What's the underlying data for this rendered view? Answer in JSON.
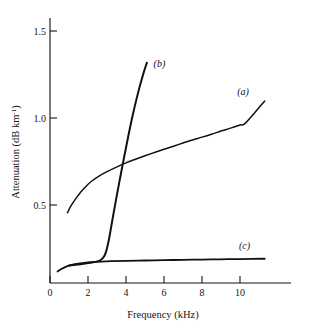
{
  "chart_data": {
    "type": "line",
    "title": "",
    "xlabel": "Frequency  (kHz)",
    "ylabel": "Attenuation (dB km",
    "ylabel_sup": "-1",
    "ylabel_close": ")",
    "xlim": [
      0,
      12.6
    ],
    "ylim": [
      0,
      1.525
    ],
    "grid": false,
    "legend_position": "inline-curve-labels",
    "xticks": [
      0,
      2,
      4,
      6,
      8,
      10
    ],
    "xtick_labels": [
      "0",
      "2",
      "4",
      "6",
      "8",
      "10"
    ],
    "yticks": [
      0.5,
      1.0,
      1.5
    ],
    "ytick_labels": [
      "0.5",
      "1.0",
      "1.5"
    ],
    "series": [
      {
        "name": "a",
        "label": "(a)",
        "label_x": 9.85,
        "label_y": 1.135,
        "x": [
          0.92,
          1.1,
          1.35,
          1.6,
          1.9,
          2.2,
          2.6,
          3.0,
          3.5,
          4.0,
          4.5,
          5.0,
          5.5,
          6.0,
          6.5,
          7.0,
          7.5,
          8.0,
          8.5,
          9.0,
          9.5,
          10.0,
          10.3,
          11.3
        ],
        "y": [
          0.455,
          0.495,
          0.535,
          0.572,
          0.608,
          0.638,
          0.668,
          0.692,
          0.718,
          0.742,
          0.763,
          0.783,
          0.802,
          0.82,
          0.838,
          0.856,
          0.874,
          0.89,
          0.907,
          0.925,
          0.942,
          0.96,
          0.972,
          1.098
        ]
      },
      {
        "name": "b",
        "label": "(b)",
        "label_x": 5.45,
        "label_y": 1.292,
        "x": [
          1.0,
          1.6,
          2.1,
          2.5,
          2.72,
          2.85,
          2.96,
          3.05,
          3.15,
          3.3,
          3.5,
          3.75,
          4.0,
          4.3,
          4.6,
          4.9,
          5.1
        ],
        "y": [
          0.152,
          0.16,
          0.168,
          0.176,
          0.188,
          0.205,
          0.235,
          0.275,
          0.33,
          0.425,
          0.545,
          0.69,
          0.83,
          0.99,
          1.13,
          1.25,
          1.318
        ]
      },
      {
        "name": "c",
        "label": "(c)",
        "label_x": 9.95,
        "label_y": 0.245,
        "x": [
          0.4,
          0.6,
          0.85,
          1.1,
          1.4,
          1.8,
          2.2,
          2.7,
          3.2,
          4.0,
          5.0,
          6.0,
          7.0,
          8.0,
          9.0,
          10.0,
          11.3
        ],
        "y": [
          0.118,
          0.132,
          0.146,
          0.155,
          0.162,
          0.168,
          0.172,
          0.175,
          0.177,
          0.179,
          0.181,
          0.183,
          0.185,
          0.186,
          0.188,
          0.189,
          0.191
        ]
      }
    ],
    "colors": {
      "axis": "#151515",
      "curve": "#111111",
      "background": "#ffffff"
    }
  }
}
